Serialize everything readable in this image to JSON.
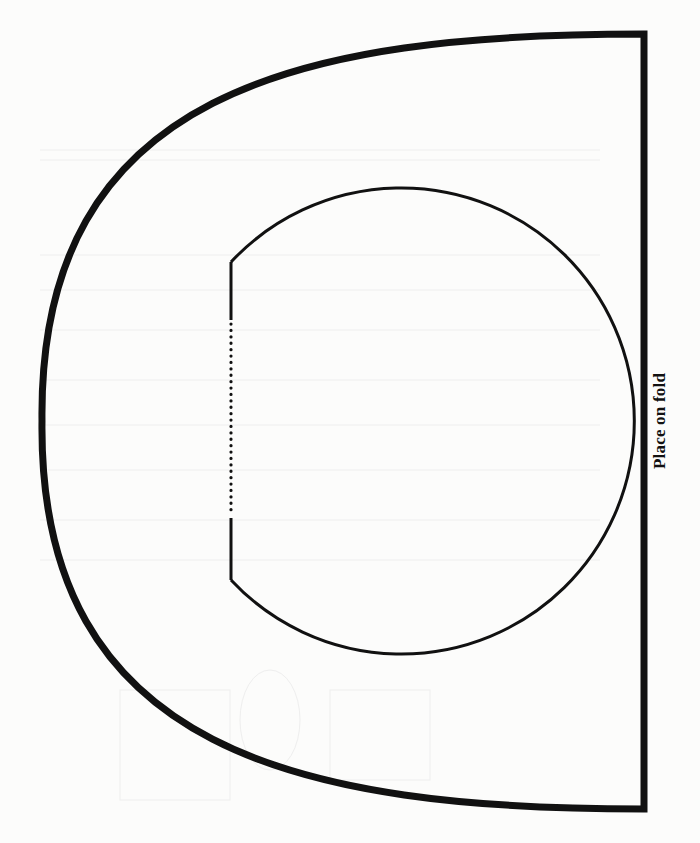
{
  "template": {
    "fold_label": "Place on fold",
    "colors": {
      "ink": "#111111",
      "paper": "#fcfcfb",
      "bleed": "#ececec"
    },
    "outer_shape": {
      "stroke_width": 7,
      "right_edge_x": 644,
      "top_y": 34,
      "bottom_y": 809,
      "leftmost_x": 42
    },
    "inner_shape": {
      "stroke_width": 3,
      "center": [
        392,
        421
      ],
      "radius": 233,
      "flat_edge_x": 231,
      "flat_edge_top_y": 262,
      "flat_edge_bottom_y": 580,
      "dotted_segment": {
        "top_y": 322,
        "bottom_y": 512,
        "dot_spacing": 6.3
      }
    }
  }
}
